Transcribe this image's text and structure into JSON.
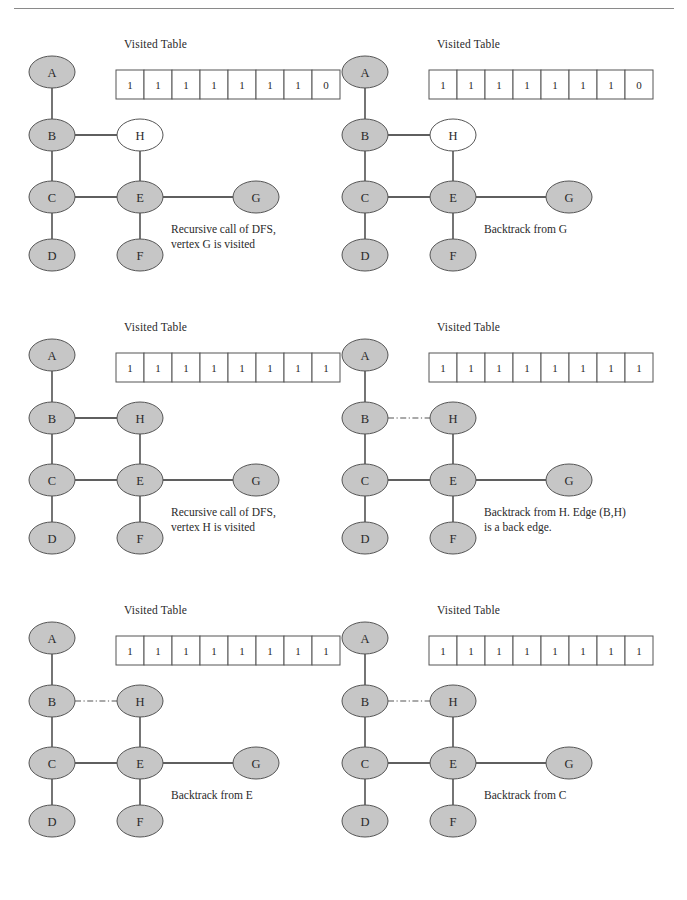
{
  "figure": {
    "colors": {
      "node_fill_visited": "#c6c6c6",
      "node_fill_unvisited": "#ffffff",
      "node_stroke": "#555555",
      "edge": "#2a2a2a",
      "back_edge": "#555555",
      "table_border": "#555555",
      "text": "#2a2a2a",
      "rule": "#8a8a8a"
    },
    "table_label": "Visited Table",
    "vertex_order": [
      "A",
      "B",
      "C",
      "D",
      "E",
      "F",
      "G",
      "H"
    ]
  },
  "panels": [
    {
      "id": "panel-1",
      "caption": "Recursive call of DFS,\nvertex G is visited",
      "caption_justify": true,
      "visited_table": [
        "1",
        "1",
        "1",
        "1",
        "1",
        "1",
        "1",
        "0"
      ],
      "nodes": [
        {
          "id": "A",
          "label": "A",
          "visited": true
        },
        {
          "id": "B",
          "label": "B",
          "visited": true
        },
        {
          "id": "C",
          "label": "C",
          "visited": true
        },
        {
          "id": "D",
          "label": "D",
          "visited": true
        },
        {
          "id": "E",
          "label": "E",
          "visited": true
        },
        {
          "id": "F",
          "label": "F",
          "visited": true
        },
        {
          "id": "G",
          "label": "G",
          "visited": true
        },
        {
          "id": "H",
          "label": "H",
          "visited": false
        }
      ],
      "edges": [
        {
          "from": "A",
          "to": "B",
          "style": "solid"
        },
        {
          "from": "B",
          "to": "H",
          "style": "solid"
        },
        {
          "from": "B",
          "to": "C",
          "style": "solid"
        },
        {
          "from": "H",
          "to": "E",
          "style": "solid"
        },
        {
          "from": "C",
          "to": "E",
          "style": "solid"
        },
        {
          "from": "C",
          "to": "D",
          "style": "solid"
        },
        {
          "from": "E",
          "to": "F",
          "style": "solid"
        },
        {
          "from": "E",
          "to": "G",
          "style": "solid"
        }
      ]
    },
    {
      "id": "panel-2",
      "caption": "Backtrack from G",
      "caption_justify": false,
      "visited_table": [
        "1",
        "1",
        "1",
        "1",
        "1",
        "1",
        "1",
        "0"
      ],
      "nodes": [
        {
          "id": "A",
          "label": "A",
          "visited": true
        },
        {
          "id": "B",
          "label": "B",
          "visited": true
        },
        {
          "id": "C",
          "label": "C",
          "visited": true
        },
        {
          "id": "D",
          "label": "D",
          "visited": true
        },
        {
          "id": "E",
          "label": "E",
          "visited": true
        },
        {
          "id": "F",
          "label": "F",
          "visited": true
        },
        {
          "id": "G",
          "label": "G",
          "visited": true
        },
        {
          "id": "H",
          "label": "H",
          "visited": false
        }
      ],
      "edges": [
        {
          "from": "A",
          "to": "B",
          "style": "solid"
        },
        {
          "from": "B",
          "to": "H",
          "style": "solid"
        },
        {
          "from": "B",
          "to": "C",
          "style": "solid"
        },
        {
          "from": "H",
          "to": "E",
          "style": "solid"
        },
        {
          "from": "C",
          "to": "E",
          "style": "solid"
        },
        {
          "from": "C",
          "to": "D",
          "style": "solid"
        },
        {
          "from": "E",
          "to": "F",
          "style": "solid"
        },
        {
          "from": "E",
          "to": "G",
          "style": "solid"
        }
      ]
    },
    {
      "id": "panel-3",
      "caption": "Recursive call of DFS,\nvertex H is visited",
      "caption_justify": true,
      "visited_table": [
        "1",
        "1",
        "1",
        "1",
        "1",
        "1",
        "1",
        "1"
      ],
      "nodes": [
        {
          "id": "A",
          "label": "A",
          "visited": true
        },
        {
          "id": "B",
          "label": "B",
          "visited": true
        },
        {
          "id": "C",
          "label": "C",
          "visited": true
        },
        {
          "id": "D",
          "label": "D",
          "visited": true
        },
        {
          "id": "E",
          "label": "E",
          "visited": true
        },
        {
          "id": "F",
          "label": "F",
          "visited": true
        },
        {
          "id": "G",
          "label": "G",
          "visited": true
        },
        {
          "id": "H",
          "label": "H",
          "visited": true
        }
      ],
      "edges": [
        {
          "from": "A",
          "to": "B",
          "style": "solid"
        },
        {
          "from": "B",
          "to": "H",
          "style": "solid"
        },
        {
          "from": "B",
          "to": "C",
          "style": "solid"
        },
        {
          "from": "H",
          "to": "E",
          "style": "solid"
        },
        {
          "from": "C",
          "to": "E",
          "style": "solid"
        },
        {
          "from": "C",
          "to": "D",
          "style": "solid"
        },
        {
          "from": "E",
          "to": "F",
          "style": "solid"
        },
        {
          "from": "E",
          "to": "G",
          "style": "solid"
        }
      ]
    },
    {
      "id": "panel-4",
      "caption": "Backtrack from H. Edge (B,H)\nis a back edge.",
      "caption_justify": false,
      "visited_table": [
        "1",
        "1",
        "1",
        "1",
        "1",
        "1",
        "1",
        "1"
      ],
      "nodes": [
        {
          "id": "A",
          "label": "A",
          "visited": true
        },
        {
          "id": "B",
          "label": "B",
          "visited": true
        },
        {
          "id": "C",
          "label": "C",
          "visited": true
        },
        {
          "id": "D",
          "label": "D",
          "visited": true
        },
        {
          "id": "E",
          "label": "E",
          "visited": true
        },
        {
          "id": "F",
          "label": "F",
          "visited": true
        },
        {
          "id": "G",
          "label": "G",
          "visited": true
        },
        {
          "id": "H",
          "label": "H",
          "visited": true
        }
      ],
      "edges": [
        {
          "from": "A",
          "to": "B",
          "style": "solid"
        },
        {
          "from": "B",
          "to": "H",
          "style": "dashdot"
        },
        {
          "from": "B",
          "to": "C",
          "style": "solid"
        },
        {
          "from": "H",
          "to": "E",
          "style": "solid"
        },
        {
          "from": "C",
          "to": "E",
          "style": "solid"
        },
        {
          "from": "C",
          "to": "D",
          "style": "solid"
        },
        {
          "from": "E",
          "to": "F",
          "style": "solid"
        },
        {
          "from": "E",
          "to": "G",
          "style": "solid"
        }
      ]
    },
    {
      "id": "panel-5",
      "caption": "Backtrack from E",
      "caption_justify": false,
      "visited_table": [
        "1",
        "1",
        "1",
        "1",
        "1",
        "1",
        "1",
        "1"
      ],
      "nodes": [
        {
          "id": "A",
          "label": "A",
          "visited": true
        },
        {
          "id": "B",
          "label": "B",
          "visited": true
        },
        {
          "id": "C",
          "label": "C",
          "visited": true
        },
        {
          "id": "D",
          "label": "D",
          "visited": true
        },
        {
          "id": "E",
          "label": "E",
          "visited": true
        },
        {
          "id": "F",
          "label": "F",
          "visited": true
        },
        {
          "id": "G",
          "label": "G",
          "visited": true
        },
        {
          "id": "H",
          "label": "H",
          "visited": true
        }
      ],
      "edges": [
        {
          "from": "A",
          "to": "B",
          "style": "solid"
        },
        {
          "from": "B",
          "to": "H",
          "style": "dashdot"
        },
        {
          "from": "B",
          "to": "C",
          "style": "solid"
        },
        {
          "from": "H",
          "to": "E",
          "style": "solid"
        },
        {
          "from": "C",
          "to": "E",
          "style": "solid"
        },
        {
          "from": "C",
          "to": "D",
          "style": "solid"
        },
        {
          "from": "E",
          "to": "F",
          "style": "solid"
        },
        {
          "from": "E",
          "to": "G",
          "style": "solid"
        }
      ]
    },
    {
      "id": "panel-6",
      "caption": "Backtrack from C",
      "caption_justify": false,
      "visited_table": [
        "1",
        "1",
        "1",
        "1",
        "1",
        "1",
        "1",
        "1"
      ],
      "nodes": [
        {
          "id": "A",
          "label": "A",
          "visited": true
        },
        {
          "id": "B",
          "label": "B",
          "visited": true
        },
        {
          "id": "C",
          "label": "C",
          "visited": true
        },
        {
          "id": "D",
          "label": "D",
          "visited": true
        },
        {
          "id": "E",
          "label": "E",
          "visited": true
        },
        {
          "id": "F",
          "label": "F",
          "visited": true
        },
        {
          "id": "G",
          "label": "G",
          "visited": true
        },
        {
          "id": "H",
          "label": "H",
          "visited": true
        }
      ],
      "edges": [
        {
          "from": "A",
          "to": "B",
          "style": "solid"
        },
        {
          "from": "B",
          "to": "H",
          "style": "dashdot"
        },
        {
          "from": "B",
          "to": "C",
          "style": "solid"
        },
        {
          "from": "H",
          "to": "E",
          "style": "solid"
        },
        {
          "from": "C",
          "to": "E",
          "style": "solid"
        },
        {
          "from": "C",
          "to": "D",
          "style": "solid"
        },
        {
          "from": "E",
          "to": "F",
          "style": "solid"
        },
        {
          "from": "E",
          "to": "G",
          "style": "solid"
        }
      ]
    }
  ],
  "layout": {
    "panel_origins": [
      {
        "x": 14,
        "y": 30
      },
      {
        "x": 327,
        "y": 30
      },
      {
        "x": 14,
        "y": 313
      },
      {
        "x": 327,
        "y": 313
      },
      {
        "x": 14,
        "y": 596
      },
      {
        "x": 327,
        "y": 596
      }
    ],
    "node_positions": {
      "A": {
        "x": 38,
        "y": 42
      },
      "B": {
        "x": 38,
        "y": 105
      },
      "C": {
        "x": 38,
        "y": 167
      },
      "D": {
        "x": 38,
        "y": 225
      },
      "E": {
        "x": 126,
        "y": 167
      },
      "F": {
        "x": 126,
        "y": 225
      },
      "G": {
        "x": 242,
        "y": 167
      },
      "H": {
        "x": 126,
        "y": 105
      }
    },
    "node_rx": 23,
    "node_ry": 16,
    "table": {
      "x": 102,
      "y": 40,
      "cell_w": 28,
      "cell_h": 29
    },
    "table_label_pos": {
      "x": 110,
      "y": 8
    },
    "caption_pos": {
      "x": 157,
      "y": 192
    }
  }
}
